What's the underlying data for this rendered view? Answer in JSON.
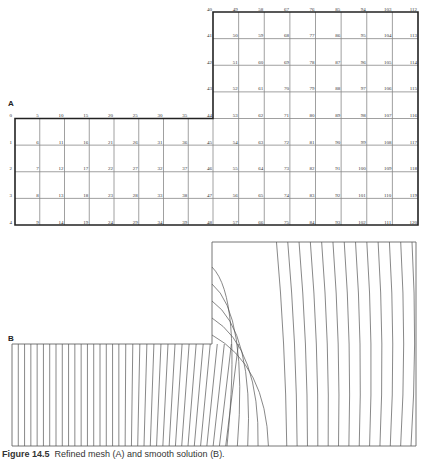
{
  "panel_a": {
    "label": "A",
    "description": "Finite-difference grid of an L-shaped domain with numbered nodes",
    "lower_block": {
      "columns": 9,
      "rows": 4,
      "top_row_labels": [
        "0",
        "5",
        "10",
        "15",
        "20",
        "25",
        "30",
        "35",
        "44"
      ],
      "left_col_labels": [
        "1",
        "2",
        "3",
        "4"
      ]
    },
    "upper_block": {
      "top_row_labels": [
        "40",
        "49",
        "58",
        "67",
        "76",
        "85",
        "94",
        "103",
        "112"
      ],
      "left_col_labels": [
        "41",
        "42",
        "43",
        "44"
      ]
    },
    "node_numbering": "column-major, 9 nodes per column on right block (40-48, 49-57, ...), 5 per column on left block (0-4, 5-9, ...)"
  },
  "panel_b": {
    "label": "B",
    "description": "Contour lines of the solution over the L-shaped domain"
  },
  "caption": {
    "prefix": "Figure 14.5",
    "text": "Refined mesh (A) and smooth solution (B)."
  }
}
